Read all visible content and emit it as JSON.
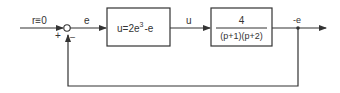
{
  "diagram": {
    "type": "block-diagram",
    "input": {
      "label": "r≡0"
    },
    "summing_junction": {
      "plus_sign": "+",
      "minus_sign": "–"
    },
    "error_signal": {
      "label": "e"
    },
    "block1": {
      "expr_main": "u=2e",
      "expr_sup": "3",
      "expr_tail": "-e"
    },
    "control_signal": {
      "label": "u"
    },
    "block2": {
      "numerator": "4",
      "denominator": "(p+1)(p+2)"
    },
    "output": {
      "label": "-e"
    },
    "colors": {
      "line": "#333333",
      "background": "#ffffff"
    }
  }
}
